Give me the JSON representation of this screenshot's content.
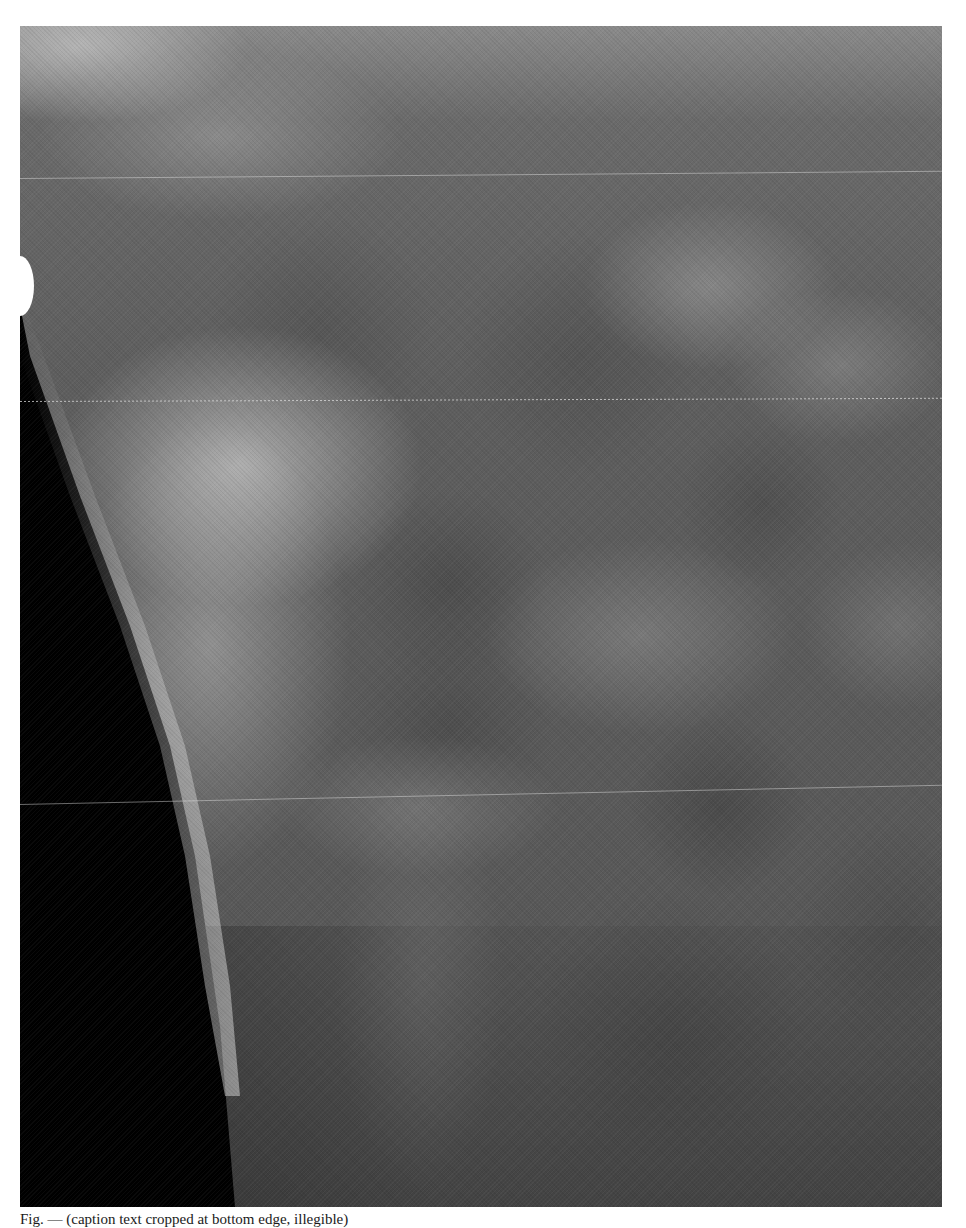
{
  "figure": {
    "type": "radiograph",
    "colors": {
      "tissue_base": "#5b5b5b",
      "air": "#000000",
      "skin_line": "#f0f0f0",
      "page_background": "#ffffff"
    },
    "artifact_lines": [
      {
        "y": 178,
        "style": "solid"
      },
      {
        "y": 376,
        "style": "dotted"
      },
      {
        "y": 772,
        "style": "solid"
      }
    ]
  },
  "caption": {
    "text": "Fig. — (caption text cropped at bottom edge, illegible)"
  }
}
